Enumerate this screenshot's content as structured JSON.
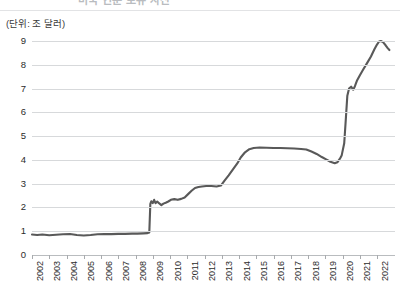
{
  "header": {
    "title_cropped": "미국 연준 보유 자산",
    "unit_caption": "(단위: 조 달러)"
  },
  "chart_data": {
    "type": "line",
    "title": "",
    "xlabel": "",
    "ylabel": "",
    "unit": "조 달러",
    "ylim": [
      0,
      9
    ],
    "yticks": [
      0,
      1,
      2,
      3,
      4,
      5,
      6,
      7,
      8,
      9
    ],
    "ytick_labels": [
      "0",
      "1",
      "2",
      "3",
      "4",
      "5",
      "6",
      "7",
      "8",
      "9"
    ],
    "grid": true,
    "legend": "none",
    "line_color": "#595959",
    "line_width": 2.1,
    "categories": [
      "2002",
      "2003",
      "2004",
      "2005",
      "2006",
      "2007",
      "2008",
      "2009",
      "2010",
      "2011",
      "2012",
      "2013",
      "2014",
      "2015",
      "2016",
      "2017",
      "2018",
      "2019",
      "2020",
      "2021",
      "2022"
    ],
    "x": [
      2002,
      2003,
      2004,
      2005,
      2006,
      2007,
      2008,
      2009,
      2010,
      2011,
      2012,
      2013,
      2014,
      2015,
      2016,
      2017,
      2018,
      2019,
      2020,
      2021,
      2022
    ],
    "values": [
      0.86,
      0.83,
      0.87,
      0.89,
      0.88,
      0.89,
      0.92,
      2.24,
      2.4,
      2.62,
      2.9,
      3.0,
      4.03,
      4.49,
      4.48,
      4.46,
      4.35,
      3.9,
      7.05,
      8.3,
      8.62
    ],
    "series": [
      {
        "name": "보유 자산",
        "points": [
          [
            2002.0,
            0.86
          ],
          [
            2002.3,
            0.84
          ],
          [
            2002.6,
            0.86
          ],
          [
            2003.0,
            0.83
          ],
          [
            2003.4,
            0.85
          ],
          [
            2003.8,
            0.87
          ],
          [
            2004.2,
            0.88
          ],
          [
            2004.6,
            0.84
          ],
          [
            2005.0,
            0.82
          ],
          [
            2005.4,
            0.84
          ],
          [
            2005.8,
            0.87
          ],
          [
            2006.2,
            0.88
          ],
          [
            2006.6,
            0.88
          ],
          [
            2007.0,
            0.89
          ],
          [
            2007.4,
            0.89
          ],
          [
            2007.8,
            0.9
          ],
          [
            2008.1,
            0.9
          ],
          [
            2008.45,
            0.91
          ],
          [
            2008.7,
            0.92
          ],
          [
            2008.8,
            0.95
          ],
          [
            2008.86,
            2.15
          ],
          [
            2008.92,
            2.26
          ],
          [
            2009.0,
            2.18
          ],
          [
            2009.08,
            2.32
          ],
          [
            2009.16,
            2.18
          ],
          [
            2009.26,
            2.25
          ],
          [
            2009.36,
            2.18
          ],
          [
            2009.5,
            2.1
          ],
          [
            2009.62,
            2.16
          ],
          [
            2009.75,
            2.2
          ],
          [
            2009.9,
            2.25
          ],
          [
            2010.05,
            2.32
          ],
          [
            2010.25,
            2.35
          ],
          [
            2010.45,
            2.32
          ],
          [
            2010.65,
            2.36
          ],
          [
            2010.85,
            2.42
          ],
          [
            2011.05,
            2.56
          ],
          [
            2011.25,
            2.7
          ],
          [
            2011.45,
            2.82
          ],
          [
            2011.65,
            2.86
          ],
          [
            2011.85,
            2.88
          ],
          [
            2012.1,
            2.9
          ],
          [
            2012.4,
            2.9
          ],
          [
            2012.7,
            2.88
          ],
          [
            2012.95,
            2.92
          ],
          [
            2013.15,
            3.12
          ],
          [
            2013.4,
            3.35
          ],
          [
            2013.65,
            3.6
          ],
          [
            2013.9,
            3.85
          ],
          [
            2014.1,
            4.1
          ],
          [
            2014.35,
            4.32
          ],
          [
            2014.6,
            4.45
          ],
          [
            2014.85,
            4.5
          ],
          [
            2015.2,
            4.52
          ],
          [
            2015.6,
            4.51
          ],
          [
            2016.0,
            4.5
          ],
          [
            2016.4,
            4.5
          ],
          [
            2016.8,
            4.49
          ],
          [
            2017.2,
            4.48
          ],
          [
            2017.6,
            4.46
          ],
          [
            2017.9,
            4.44
          ],
          [
            2018.2,
            4.35
          ],
          [
            2018.5,
            4.25
          ],
          [
            2018.8,
            4.12
          ],
          [
            2019.05,
            4.02
          ],
          [
            2019.3,
            3.92
          ],
          [
            2019.55,
            3.86
          ],
          [
            2019.7,
            3.9
          ],
          [
            2019.85,
            4.05
          ],
          [
            2019.95,
            4.18
          ],
          [
            2020.1,
            4.7
          ],
          [
            2020.2,
            5.8
          ],
          [
            2020.28,
            6.7
          ],
          [
            2020.38,
            7.0
          ],
          [
            2020.5,
            7.08
          ],
          [
            2020.62,
            6.95
          ],
          [
            2020.72,
            7.1
          ],
          [
            2020.85,
            7.35
          ],
          [
            2021.0,
            7.55
          ],
          [
            2021.2,
            7.8
          ],
          [
            2021.45,
            8.1
          ],
          [
            2021.65,
            8.35
          ],
          [
            2021.85,
            8.65
          ],
          [
            2022.0,
            8.85
          ],
          [
            2022.12,
            8.98
          ],
          [
            2022.22,
            9.0
          ],
          [
            2022.35,
            8.95
          ],
          [
            2022.5,
            8.82
          ],
          [
            2022.62,
            8.7
          ],
          [
            2022.72,
            8.62
          ]
        ]
      }
    ],
    "annotations": [
      {
        "label": "2008 급등",
        "value": 2.24
      },
      {
        "label": "2020 급등",
        "value": 7.05
      },
      {
        "label": "최고점",
        "value": 9.0
      }
    ]
  }
}
